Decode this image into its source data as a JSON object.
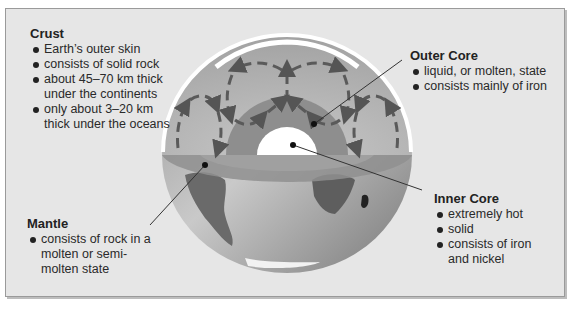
{
  "figure": {
    "colors": {
      "panel_bg": "#e6e6e6",
      "mantle": "#a9a9a9",
      "outer_core": "#8c8c8c",
      "inner_core": "#ffffff",
      "crust": "#ffffff",
      "arrows": "#5a5a5a",
      "land": "#6e6e6e",
      "ocean": "#b5b5b5"
    }
  },
  "labels": {
    "crust": {
      "title": "Crust",
      "bullets": [
        "Earth’s outer skin",
        "consists of solid rock",
        "about 45–70 km thick under the continents",
        "only about 3–20 km thick under the oceans"
      ]
    },
    "outer_core": {
      "title": "Outer Core",
      "bullets": [
        "liquid, or molten, state",
        "consists mainly of iron"
      ]
    },
    "inner_core": {
      "title": "Inner Core",
      "bullets": [
        "extremely hot",
        "solid",
        "consists of iron and nickel"
      ]
    },
    "mantle": {
      "title": "Mantle",
      "bullets": [
        "consists of rock in a molten or semi-molten state"
      ]
    }
  }
}
